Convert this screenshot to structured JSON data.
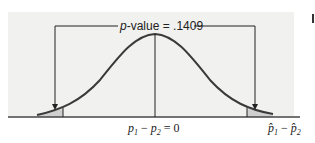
{
  "figure": {
    "title_prefix": "p",
    "title_suffix": "-value = .1409",
    "p_value": ".1409",
    "center_label": "p₁ − p₂ = 0",
    "center_label_parts": {
      "a": "p",
      "a_sub": "1",
      "minus": " − ",
      "b": "p",
      "b_sub": "2",
      "eq": " = 0"
    },
    "right_label_parts": {
      "a": "p̂",
      "a_sub": "1",
      "minus": " − ",
      "b": "p̂",
      "b_sub": "2"
    },
    "colors": {
      "curve": "#3a3a3a",
      "shade": "#cfcfcf",
      "panel": "#f1f1f0",
      "lines": "#222222"
    }
  }
}
